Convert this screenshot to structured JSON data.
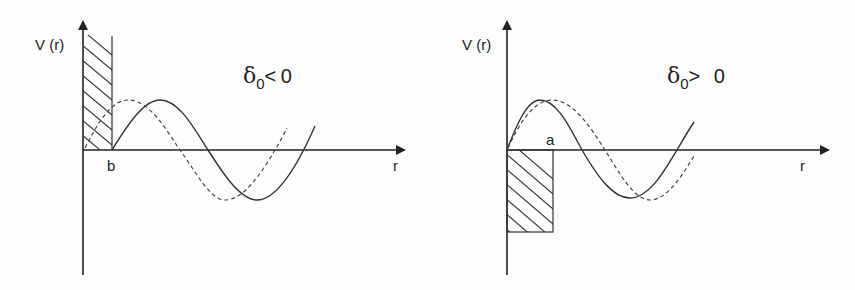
{
  "figure": {
    "panels": [
      {
        "id": "repulsive",
        "y_axis_label": "V (r)",
        "x_axis_label": "r",
        "boundary_label": "b",
        "phase_label": {
          "symbol": "δ",
          "subscript": "0",
          "relation": "<",
          "value": "0"
        },
        "potential": "hard-sphere repulsive wall (hatched) from 0 to b",
        "curves": [
          "solid: wavefunction with potential",
          "dashed: free wavefunction"
        ]
      },
      {
        "id": "attractive",
        "y_axis_label": "V (r)",
        "x_axis_label": "r",
        "boundary_label": "a",
        "phase_label": {
          "symbol": "δ",
          "subscript": "0",
          "relation": ">",
          "value": "0"
        },
        "potential": "attractive square well (hatched) from 0 to a",
        "curves": [
          "solid: wavefunction with potential",
          "dashed: free wavefunction"
        ]
      }
    ],
    "colors": {
      "line": "#2a2a2a",
      "background": "#fdfdfd"
    }
  }
}
